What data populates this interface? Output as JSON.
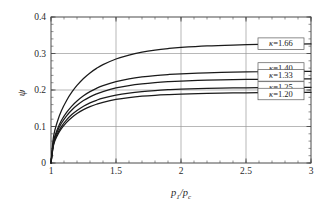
{
  "chart_data": {
    "type": "line",
    "title": "",
    "subtitle": "",
    "xlabel": "p1/pc",
    "xlabel_parts": {
      "base1": "p",
      "sub1": "1",
      "slash": "/",
      "base2": "p",
      "sub2": "c"
    },
    "ylabel": "ψ",
    "xlim": [
      1,
      3
    ],
    "ylim": [
      0,
      0.4
    ],
    "grid": true,
    "grid_axes": "both",
    "legend_position": "inline-right",
    "x_ticks": [
      {
        "value": 1,
        "label": "1"
      },
      {
        "value": 1.5,
        "label": "1.5"
      },
      {
        "value": 2,
        "label": "2"
      },
      {
        "value": 2.5,
        "label": "2.5"
      },
      {
        "value": 3,
        "label": "3"
      }
    ],
    "x_minor_interval": 0.1,
    "y_ticks": [
      {
        "value": 0,
        "label": "0"
      },
      {
        "value": 0.1,
        "label": "0.1"
      },
      {
        "value": 0.2,
        "label": "0.2"
      },
      {
        "value": 0.3,
        "label": "0.3"
      },
      {
        "value": 0.4,
        "label": "0.4"
      }
    ],
    "y_minor_interval": 0.02,
    "x": [
      1.0,
      1.02,
      1.05,
      1.08,
      1.12,
      1.16,
      1.2,
      1.25,
      1.3,
      1.35,
      1.4,
      1.5,
      1.6,
      1.7,
      1.8,
      1.9,
      2.0,
      2.2,
      2.4,
      2.6,
      2.8,
      3.0
    ],
    "series": [
      {
        "name": "κ=1.66",
        "kappa": 1.66,
        "label": "κ=1.66",
        "plateau": 0.327,
        "color": "#1a1a1a",
        "values": [
          0.0,
          0.0735,
          0.1145,
          0.1432,
          0.1714,
          0.1939,
          0.2124,
          0.2316,
          0.2468,
          0.2592,
          0.2694,
          0.2849,
          0.2958,
          0.3036,
          0.3093,
          0.3135,
          0.3166,
          0.3208,
          0.3232,
          0.3247,
          0.3257,
          0.3263
        ]
      },
      {
        "name": "κ=1.40",
        "kappa": 1.4,
        "label": "κ=1.40",
        "plateau": 0.259,
        "color": "#1a1a1a",
        "values": [
          0.0,
          0.0605,
          0.0935,
          0.1164,
          0.1385,
          0.1559,
          0.17,
          0.1843,
          0.1956,
          0.2046,
          0.2119,
          0.2229,
          0.2304,
          0.2357,
          0.2395,
          0.2423,
          0.2444,
          0.2472,
          0.2489,
          0.25,
          0.2508,
          0.2513
        ]
      },
      {
        "name": "κ=1.33",
        "kappa": 1.33,
        "label": "κ=1.33",
        "plateau": 0.24,
        "color": "#1a1a1a",
        "values": [
          0.0,
          0.0568,
          0.0876,
          0.1088,
          0.1292,
          0.1452,
          0.158,
          0.171,
          0.1812,
          0.1893,
          0.1958,
          0.2056,
          0.2122,
          0.2168,
          0.2202,
          0.2227,
          0.2245,
          0.2269,
          0.2284,
          0.2294,
          0.23,
          0.2305
        ]
      },
      {
        "name": "κ=1.25",
        "kappa": 1.25,
        "label": "κ=1.25",
        "plateau": 0.207,
        "color": "#1a1a1a",
        "values": [
          0.0,
          0.0524,
          0.0806,
          0.0999,
          0.1183,
          0.1327,
          0.1441,
          0.1557,
          0.1647,
          0.1718,
          0.1775,
          0.186,
          0.1917,
          0.1957,
          0.1986,
          0.2007,
          0.2023,
          0.2043,
          0.2056,
          0.2064,
          0.207,
          0.2074
        ]
      },
      {
        "name": "κ=1.20",
        "kappa": 1.2,
        "label": "κ=1.20",
        "plateau": 0.189,
        "color": "#1a1a1a",
        "values": [
          0.0,
          0.0496,
          0.0762,
          0.0942,
          0.1115,
          0.1249,
          0.1355,
          0.1462,
          0.1545,
          0.161,
          0.1663,
          0.174,
          0.1792,
          0.1829,
          0.1855,
          0.1874,
          0.1888,
          0.1907,
          0.1918,
          0.1925,
          0.193,
          0.1934
        ]
      }
    ],
    "legend_boxes": [
      {
        "label": "κ=1.66",
        "kappa_glyph": "κ",
        "value_text": "=1.66",
        "y_value": 0.327
      },
      {
        "label": "κ=1.40",
        "kappa_glyph": "κ",
        "value_text": "=1.40",
        "y_value": 0.259
      },
      {
        "label": "κ=1.33",
        "kappa_glyph": "κ",
        "value_text": "=1.33",
        "y_value": 0.24
      },
      {
        "label": "κ=1.25",
        "kappa_glyph": "κ",
        "value_text": "=1.25",
        "y_value": 0.207
      },
      {
        "label": "κ=1.20",
        "kappa_glyph": "κ",
        "value_text": "=1.20",
        "y_value": 0.189
      }
    ]
  },
  "colors": {
    "frame": "#4a4a4a",
    "grid": "#9a9a9a",
    "curve": "#1a1a1a",
    "legend_border": "#5a5a5a",
    "legend_fill": "#ffffff",
    "background": "#ffffff",
    "text": "#2a2a2a"
  }
}
